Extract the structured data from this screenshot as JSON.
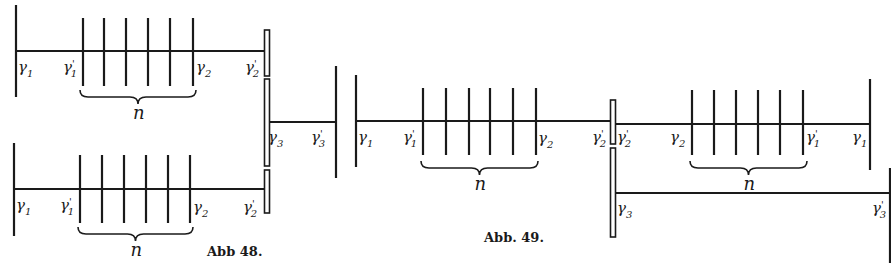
{
  "figures": [
    {
      "id": "abb48",
      "caption": "Abb 48.",
      "caption_pos": [
        207,
        256
      ],
      "systems": [
        {
          "name": "upper-train",
          "axis": {
            "x1": 16,
            "x2": 267,
            "y": 51
          },
          "left_wall": {
            "x": 16,
            "y1": 5,
            "y2": 97
          },
          "comb": {
            "xs": [
              83,
              104,
              126,
              148,
              170,
              193
            ],
            "y1": 18,
            "y2": 86
          },
          "brace": {
            "x1": 80,
            "x2": 196,
            "y": 97,
            "label": "n"
          },
          "labels": [
            {
              "text": "γ",
              "sub": "1",
              "prime": false,
              "x": 18,
              "y": 72
            },
            {
              "text": "γ",
              "sub": "1",
              "prime": true,
              "x": 63,
              "y": 72
            },
            {
              "text": "γ",
              "sub": "2",
              "prime": false,
              "x": 196,
              "y": 72
            },
            {
              "text": "γ",
              "sub": "2",
              "prime": true,
              "x": 245,
              "y": 72
            }
          ]
        },
        {
          "name": "lower-train",
          "axis": {
            "x1": 14,
            "x2": 265,
            "y": 189
          },
          "left_wall": {
            "x": 14,
            "y1": 143,
            "y2": 236
          },
          "comb": {
            "xs": [
              80,
              102,
              124,
              146,
              168,
              190
            ],
            "y1": 155,
            "y2": 223
          },
          "brace": {
            "x1": 78,
            "x2": 193,
            "y": 234,
            "label": "n"
          },
          "labels": [
            {
              "text": "γ",
              "sub": "1",
              "prime": false,
              "x": 16,
              "y": 210
            },
            {
              "text": "γ",
              "sub": "1",
              "prime": true,
              "x": 60,
              "y": 210
            },
            {
              "text": "γ",
              "sub": "2",
              "prime": false,
              "x": 193,
              "y": 212
            },
            {
              "text": "γ",
              "sub": "2",
              "prime": true,
              "x": 243,
              "y": 212
            }
          ]
        },
        {
          "name": "third-stage",
          "axis": {
            "x1": 268,
            "x2": 336,
            "y": 122
          },
          "right_wall": {
            "x": 336,
            "y1": 66,
            "y2": 178
          },
          "labels": [
            {
              "text": "γ",
              "sub": "3",
              "prime": false,
              "x": 268,
              "y": 142
            },
            {
              "text": "γ",
              "sub": "3",
              "prime": true,
              "x": 311,
              "y": 142
            }
          ]
        }
      ],
      "separators": [
        {
          "x": 267,
          "y1": 30,
          "y2": 76
        },
        {
          "x": 267,
          "y1": 79,
          "y2": 166
        },
        {
          "x": 267,
          "y1": 170,
          "y2": 213
        }
      ]
    },
    {
      "id": "abb49",
      "caption": "Abb. 49.",
      "caption_pos": [
        484,
        242
      ],
      "systems": [
        {
          "name": "left-train",
          "axis": {
            "x1": 356,
            "x2": 613,
            "y": 121
          },
          "left_wall": {
            "x": 356,
            "y1": 75,
            "y2": 167
          },
          "comb": {
            "xs": [
              423,
              446,
              469,
              490,
              513,
              536
            ],
            "y1": 88,
            "y2": 155
          },
          "brace": {
            "x1": 421,
            "x2": 538,
            "y": 168,
            "label": "n"
          },
          "labels": [
            {
              "text": "γ",
              "sub": "1",
              "prime": false,
              "x": 358,
              "y": 142
            },
            {
              "text": "γ",
              "sub": "1",
              "prime": true,
              "x": 403,
              "y": 142
            },
            {
              "text": "γ",
              "sub": "2",
              "prime": false,
              "x": 538,
              "y": 143
            },
            {
              "text": "γ",
              "sub": "2",
              "prime": true,
              "x": 592,
              "y": 142
            }
          ]
        },
        {
          "name": "right-train",
          "axis": {
            "x1": 613,
            "x2": 870,
            "y": 124
          },
          "right_wall": {
            "x": 870,
            "y1": 79,
            "y2": 170
          },
          "comb": {
            "xs": [
              692,
              714,
              736,
              758,
              780,
              803
            ],
            "y1": 90,
            "y2": 155
          },
          "brace": {
            "x1": 690,
            "x2": 807,
            "y": 168,
            "label": "n"
          },
          "labels": [
            {
              "text": "γ",
              "sub": "2",
              "prime": true,
              "x": 617,
              "y": 142
            },
            {
              "text": "γ",
              "sub": "2",
              "prime": false,
              "x": 670,
              "y": 142
            },
            {
              "text": "γ",
              "sub": "1",
              "prime": true,
              "x": 806,
              "y": 142
            },
            {
              "text": "γ",
              "sub": "1",
              "prime": false,
              "x": 852,
              "y": 142
            }
          ]
        },
        {
          "name": "third-stage",
          "axis": {
            "x1": 615,
            "x2": 891,
            "y": 193
          },
          "right_wall": {
            "x": 890,
            "y1": 168,
            "y2": 263
          },
          "labels": [
            {
              "text": "γ",
              "sub": "3",
              "prime": false,
              "x": 617,
              "y": 213
            },
            {
              "text": "γ",
              "sub": "3",
              "prime": true,
              "x": 872,
              "y": 213
            }
          ]
        }
      ],
      "separators": [
        {
          "x": 613,
          "y1": 100,
          "y2": 144
        },
        {
          "x": 613,
          "y1": 148,
          "y2": 237
        }
      ]
    }
  ],
  "brace_label": "n"
}
